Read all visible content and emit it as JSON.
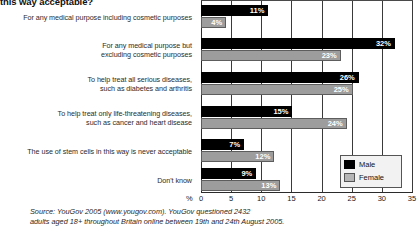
{
  "chart_data": {
    "type": "bar",
    "orientation": "horizontal",
    "title": "this way acceptable?",
    "xlabel": "%",
    "ylabel": "",
    "xlim": [
      0,
      35
    ],
    "xticks": [
      0,
      5,
      10,
      15,
      20,
      25,
      30,
      35
    ],
    "grid": true,
    "legend_position": "bottom-right",
    "categories": [
      "For any medical purpose including cosmetic purposes",
      "For any medical purpose but excluding cosmetic purposes",
      "To help treat all serious diseases, such as diabetes and arthritis",
      "To help treat only life-threatening diseases, such as cancer and heart disease",
      "The use of stem cells in this way is never acceptable",
      "Don't know"
    ],
    "series": [
      {
        "name": "Male",
        "color": "#000000",
        "values": [
          11,
          32,
          26,
          15,
          7,
          9
        ]
      },
      {
        "name": "Female",
        "color": "#9d9d9d",
        "values": [
          4,
          23,
          25,
          24,
          12,
          13
        ]
      }
    ],
    "value_labels": {
      "Male": [
        "11%",
        "32%",
        "26%",
        "15%",
        "7%",
        "9%"
      ],
      "Female": [
        "4%",
        "23%",
        "25%",
        "24%",
        "12%",
        "13%"
      ]
    }
  },
  "categories_display": [
    "For any medical purpose including cosmetic purposes",
    "For any medical purpose but\nexcluding cosmetic purposes",
    "To help treat all serious diseases,\nsuch as diabetes and arthritis",
    "To help treat only life-threatening diseases,\nsuch as cancer and heart disease",
    "The use of stem cells in this way is never acceptable",
    "Don't know"
  ],
  "legend": {
    "items": [
      {
        "label": "Male",
        "color": "#000000"
      },
      {
        "label": "Female",
        "color": "#b5b5b5"
      }
    ]
  },
  "axis": {
    "percent_symbol": "%",
    "tick_labels": [
      "0",
      "5",
      "10",
      "15",
      "20",
      "25",
      "30",
      "35"
    ]
  },
  "source": {
    "line1": "Source: YouGov 2005 (www.yougov.com). YouGov questioned 2432",
    "line2": "adults aged 18+ throughout Britain online between 19th and 24th August 2005."
  }
}
